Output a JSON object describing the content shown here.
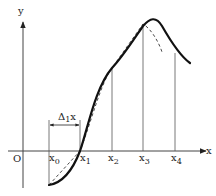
{
  "diagram": {
    "axes": {
      "x_label": "x",
      "y_label": "y",
      "origin_label": "O"
    },
    "points": [
      {
        "name": "x0",
        "base": "x",
        "sub": "0"
      },
      {
        "name": "x1",
        "base": "x",
        "sub": "1"
      },
      {
        "name": "x2",
        "base": "x",
        "sub": "2"
      },
      {
        "name": "x3",
        "base": "x",
        "sub": "3"
      },
      {
        "name": "x4",
        "base": "x",
        "sub": "4"
      }
    ],
    "interval": {
      "label_base": "Δ",
      "label_sub": "1",
      "label_tail": "x"
    },
    "curves": {
      "solid": "function curve",
      "dashed": "approximating polyline / secant curve"
    },
    "colors": {
      "stroke": "#111111",
      "guide": "#555555",
      "background": "#ffffff"
    }
  }
}
